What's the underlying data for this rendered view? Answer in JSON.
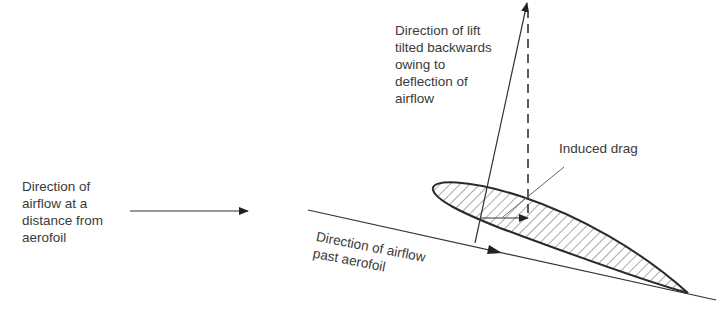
{
  "diagram": {
    "labels": {
      "lift_direction": "Direction of lift\ntilted backwards\nowing to\ndeflection of\nairflow",
      "induced_drag": "Induced drag",
      "airflow_far": "Direction of\nairflow at a\ndistance from\naerofoil",
      "airflow_past": "Direction of airflow\npast aerofoil"
    },
    "elements": {
      "aerofoil": {
        "leading_edge": [
          433,
          190
        ],
        "trailing_edge": [
          688,
          293
        ],
        "fill": "hatched"
      },
      "lift_vector_tilted": {
        "from": [
          475,
          243
        ],
        "to": [
          527,
          2
        ],
        "style": "solid-arrow"
      },
      "lift_vector_vertical": {
        "from": [
          528,
          213
        ],
        "to": [
          528,
          8
        ],
        "style": "dashed"
      },
      "induced_drag_vector": {
        "from": [
          480,
          218
        ],
        "to": [
          528,
          218
        ],
        "style": "solid-arrow"
      },
      "airflow_far_arrow": {
        "from": [
          130,
          211
        ],
        "to": [
          248,
          211
        ]
      },
      "airflow_past_line": {
        "from": [
          308,
          210
        ],
        "to": [
          716,
          300
        ]
      }
    },
    "colors": {
      "line": "#333333",
      "text": "#3a3a3a",
      "background": "#ffffff"
    }
  }
}
